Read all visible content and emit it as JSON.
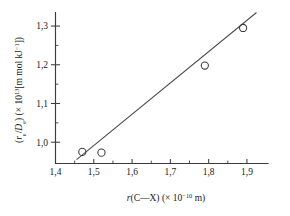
{
  "figure": {
    "background_color": "#ffffff",
    "ink_color": "#3c3c3c"
  },
  "chart_data": {
    "type": "scatter",
    "title": "",
    "subtitle": "",
    "xlabel_plain": "r(C—X) (× 10⁻¹⁰ m)",
    "ylabel_plain": "(rₑ/Dₑ) (× 10¹³[m mol kJ⁻¹])",
    "xlabel_parts": {
      "var": "r",
      "arg": "(C—X)",
      "scale_open": " (× 10",
      "scale_exp": "−10",
      "scale_close": " m)"
    },
    "ylabel_parts": {
      "open": "(",
      "num_var": "r",
      "num_sub": "e",
      "slash": "/",
      "den_var": "D",
      "den_sub": "e",
      "close_paren": ") (× 10",
      "scale_exp": "13",
      "units": "[m mol kJ",
      "units_exp": "−1",
      "units_close": "])"
    },
    "x": [
      1.47,
      1.52,
      1.79,
      1.89
    ],
    "y": [
      0.975,
      0.973,
      1.198,
      1.295
    ],
    "points": [
      {
        "x": 1.47,
        "y": 0.975
      },
      {
        "x": 1.52,
        "y": 0.973
      },
      {
        "x": 1.79,
        "y": 1.198
      },
      {
        "x": 1.89,
        "y": 1.295
      }
    ],
    "marker": "open-circle",
    "fit_line": {
      "x_start": 1.455,
      "y_start": 0.955,
      "x_end": 1.925,
      "y_end": 1.335
    },
    "xlim": [
      1.4,
      1.955
    ],
    "ylim": [
      0.945,
      1.335
    ],
    "xticks": [
      1.4,
      1.5,
      1.6,
      1.7,
      1.8,
      1.9
    ],
    "xtick_labels": [
      "1,4",
      "1,5",
      "1,6",
      "1,7",
      "1,8",
      "1,9"
    ],
    "xticks_minor": [
      1.45,
      1.55,
      1.65,
      1.75,
      1.85
    ],
    "yticks": [
      1.0,
      1.1,
      1.2,
      1.3
    ],
    "ytick_labels": [
      "1,0",
      "1,1",
      "1,2",
      "1,3"
    ],
    "yticks_minor": [
      1.05,
      1.15,
      1.25
    ],
    "grid": false,
    "legend": null,
    "legend_position": "none",
    "spines": [
      "left",
      "bottom"
    ],
    "annotations": []
  }
}
